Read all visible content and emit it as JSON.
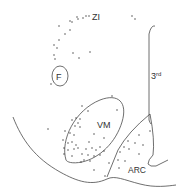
{
  "figure": {
    "labels": {
      "zi": "ZI",
      "fornix": "F",
      "third_ventricle": "3",
      "third_ventricle_sup": "rd",
      "vm": "VM",
      "arc": "ARC"
    },
    "colors": {
      "line": "#4a4a4a",
      "dot": "#333333",
      "background": "#ffffff"
    }
  }
}
